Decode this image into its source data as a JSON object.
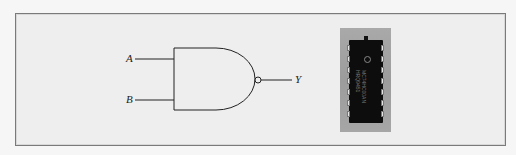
{
  "figure": {
    "gate": {
      "type": "NAND",
      "inputs": [
        {
          "label": "A"
        },
        {
          "label": "B"
        }
      ],
      "output": {
        "label": "Y"
      }
    },
    "chip": {
      "part_number": "MC74HC00AN",
      "date_code": "HRQ9451",
      "package": "DIP-14",
      "pins_per_side": 7
    },
    "colors": {
      "line": "#222222",
      "frame_border": "#7a7a7a",
      "chip_body": "#0d0d0d",
      "chip_background": "#a3a3a3"
    }
  }
}
